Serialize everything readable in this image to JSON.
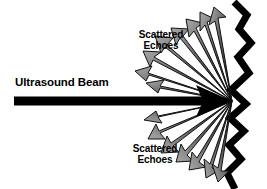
{
  "figure": {
    "type": "ultrasound-scattering-diagram",
    "background_color": "#ffffff",
    "width": 267,
    "height": 189
  },
  "labels": {
    "beam": "Ultrasound Beam",
    "scattered_top_line1": "Scattered",
    "scattered_top_line2": "Echoes",
    "scattered_bottom_line1": "Scattered",
    "scattered_bottom_line2": "Echoes"
  },
  "colors": {
    "ink": "#000000",
    "arrow_dark": "#2b2b2b",
    "arrow_mid": "#6e6e6e",
    "arrow_light": "#9a9a9a",
    "background": "#ffffff"
  },
  "geometry": {
    "focus_point": {
      "x": 232,
      "y": 101
    },
    "beam": {
      "start_x": 14,
      "end_x": 232,
      "y": 101,
      "thickness": 9
    },
    "interface_label": "rough-tissue-boundary",
    "interface_points": "234,2 246,16 240,30 250,44 239,58 248,74 232,90 245,104 231,118 244,130 230,144 240,158 228,172 236,188",
    "scattered_arrows_up": 7,
    "scattered_arrows_down": 7
  }
}
